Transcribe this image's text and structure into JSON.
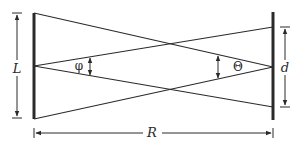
{
  "diagram": {
    "labels": {
      "L": "L",
      "d": "d",
      "R": "R",
      "phi": "φ",
      "theta": "Θ"
    },
    "colors": {
      "stroke": "#2a2a2a",
      "background": "#ffffff"
    },
    "elements": {
      "left_aperture": {
        "label": "L",
        "x": 34,
        "y_top": 13,
        "y_bottom": 119
      },
      "right_aperture": {
        "label": "d",
        "x": 273,
        "y_top": 13,
        "y_bottom": 119,
        "point_top": 27,
        "point_bottom": 107
      },
      "separation": {
        "label": "R",
        "from_x": 34,
        "to_x": 273
      },
      "angle_left": {
        "label": "φ",
        "vertex": [
          34,
          66
        ]
      },
      "angle_right": {
        "label": "Θ",
        "vertex": [
          273,
          67
        ]
      }
    }
  }
}
